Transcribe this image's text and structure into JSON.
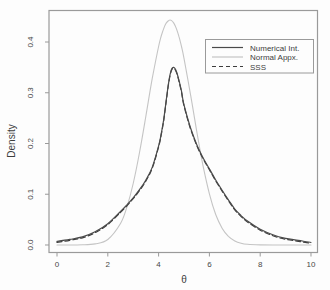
{
  "colors": {
    "background": "#fdfdfd",
    "axis": "#9a9a9a",
    "tick_text": "#474747",
    "curve_dark": "#4a4a4a",
    "curve_light": "#c4c4c4",
    "curve_dashed": "#3d3d3d"
  },
  "chart_data": {
    "type": "line",
    "title": "",
    "xlabel": "θ",
    "ylabel": "Density",
    "x_ticks": [
      0,
      2,
      4,
      6,
      8,
      10
    ],
    "y_ticks": [
      0.0,
      0.1,
      0.2,
      0.3,
      0.4
    ],
    "xlim": [
      0,
      10
    ],
    "ylim": [
      0,
      0.45
    ],
    "x_window": [
      -0.315,
      10.256
    ],
    "y_window": [
      -0.0148,
      0.4621
    ],
    "grid": "off",
    "legend_position": "top-right",
    "x": [
      0,
      0.5,
      1,
      1.5,
      2,
      2.5,
      2.75,
      3,
      3.25,
      3.5,
      3.75,
      4,
      4.1,
      4.2,
      4.3,
      4.4,
      4.5,
      4.6,
      4.7,
      4.8,
      4.9,
      5,
      5.25,
      5.5,
      5.75,
      6,
      6.25,
      6.5,
      6.75,
      7,
      7.25,
      7.5,
      8,
      8.5,
      9,
      9.5,
      10
    ],
    "series": [
      {
        "name": "Numerical Int.",
        "style": "solid",
        "color": "#4a4a4a",
        "values": [
          0.007,
          0.011,
          0.016,
          0.026,
          0.042,
          0.066,
          0.079,
          0.093,
          0.109,
          0.128,
          0.153,
          0.195,
          0.218,
          0.247,
          0.285,
          0.322,
          0.345,
          0.35,
          0.342,
          0.325,
          0.303,
          0.276,
          0.232,
          0.198,
          0.172,
          0.15,
          0.128,
          0.108,
          0.089,
          0.071,
          0.058,
          0.047,
          0.031,
          0.02,
          0.013,
          0.009,
          0.005
        ]
      },
      {
        "name": "Normal Appx.",
        "style": "solid",
        "color": "#c4c4c4",
        "values": [
          0.0,
          0.0,
          0.0003,
          0.0021,
          0.0109,
          0.0424,
          0.0745,
          0.1211,
          0.1822,
          0.2541,
          0.3277,
          0.3912,
          0.411,
          0.4264,
          0.4372,
          0.4426,
          0.4426,
          0.4372,
          0.4264,
          0.411,
          0.3912,
          0.3678,
          0.2987,
          0.2245,
          0.1562,
          0.1006,
          0.06,
          0.0331,
          0.0169,
          0.008,
          0.0035,
          0.0014,
          0.0002,
          0.0,
          0.0,
          0.0,
          0.0
        ]
      },
      {
        "name": "SSS",
        "style": "dashed",
        "color": "#3d3d3d",
        "values": [
          0.007,
          0.011,
          0.016,
          0.026,
          0.042,
          0.066,
          0.079,
          0.093,
          0.109,
          0.128,
          0.153,
          0.195,
          0.218,
          0.247,
          0.285,
          0.322,
          0.345,
          0.35,
          0.342,
          0.325,
          0.303,
          0.276,
          0.232,
          0.198,
          0.172,
          0.15,
          0.128,
          0.108,
          0.089,
          0.071,
          0.058,
          0.047,
          0.031,
          0.02,
          0.013,
          0.009,
          0.005
        ]
      }
    ]
  }
}
